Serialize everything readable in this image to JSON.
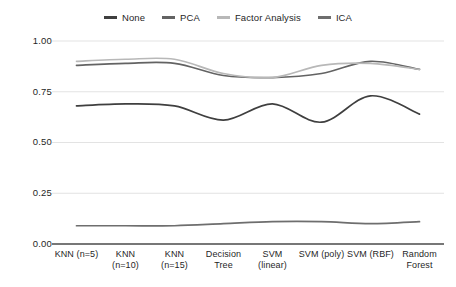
{
  "chart_data": {
    "type": "line",
    "title": "",
    "xlabel": "",
    "ylabel": "",
    "ylim": [
      0.0,
      1.0
    ],
    "yticks": [
      "0.00",
      "0.25",
      "0.50",
      "0.75",
      "1.00"
    ],
    "ytick_values": [
      0.0,
      0.25,
      0.5,
      0.75,
      1.0
    ],
    "grid": true,
    "grid_axis": "y",
    "legend_position": "top-center",
    "smoothing": "spline",
    "categories": [
      "KNN (n=5)",
      "KNN (n=10)",
      "KNN (n=15)",
      "Decision Tree",
      "SVM (linear)",
      "SVM (poly)",
      "SVM (RBF)",
      "Random Forest"
    ],
    "series": [
      {
        "name": "None",
        "color": "#3f3f3f",
        "values": [
          0.68,
          0.69,
          0.68,
          0.61,
          0.69,
          0.6,
          0.73,
          0.64
        ]
      },
      {
        "name": "PCA",
        "color": "#636363",
        "values": [
          0.88,
          0.89,
          0.89,
          0.83,
          0.82,
          0.84,
          0.9,
          0.86
        ]
      },
      {
        "name": "Factor Analysis",
        "color": "#b8b8b8",
        "values": [
          0.9,
          0.91,
          0.91,
          0.84,
          0.82,
          0.88,
          0.89,
          0.86
        ]
      },
      {
        "name": "ICA",
        "color": "#6e6e6e",
        "values": [
          0.09,
          0.09,
          0.09,
          0.1,
          0.11,
          0.11,
          0.1,
          0.11
        ]
      }
    ]
  },
  "legend": {
    "items": [
      {
        "label": "None",
        "color": "#3f3f3f"
      },
      {
        "label": "PCA",
        "color": "#636363"
      },
      {
        "label": "Factor Analysis",
        "color": "#b8b8b8"
      },
      {
        "label": "ICA",
        "color": "#6e6e6e"
      }
    ]
  },
  "axes": {
    "y_tick_labels": [
      "1.00",
      "0.75",
      "0.50",
      "0.25",
      "0.00"
    ],
    "x_tick_labels": [
      "KNN (n=5)",
      "KNN (n=10)",
      "KNN (n=15)",
      "Decision Tree",
      "SVM (linear)",
      "SVM (poly)",
      "SVM (RBF)",
      "Random Forest"
    ]
  },
  "style": {
    "grid_color": "#dcdcdc",
    "axis_color": "#4a4a4a",
    "background": "#ffffff"
  }
}
